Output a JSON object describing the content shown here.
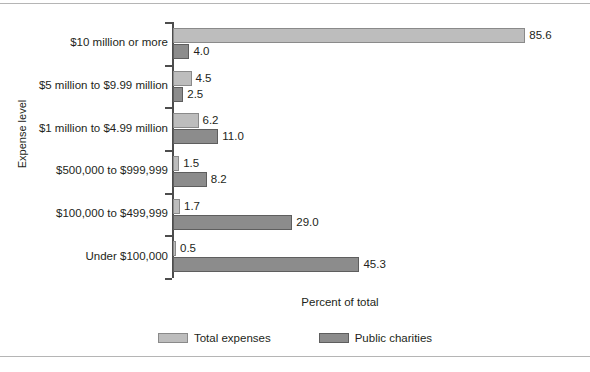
{
  "chart_data": {
    "type": "bar",
    "orientation": "horizontal",
    "title": "",
    "xlabel": "Percent of total",
    "ylabel": "Expense level",
    "xlim": [
      0,
      90
    ],
    "grid": false,
    "legend_position": "bottom",
    "categories": [
      "$10 million or more",
      "$5 million to $9.99 million",
      "$1 million to $4.99 million",
      "$500,000 to $999,999",
      "$100,000 to $499,999",
      "Under $100,000"
    ],
    "series": [
      {
        "name": "Total expenses",
        "color": "#bdbdbd",
        "values": [
          85.6,
          4.5,
          6.2,
          1.5,
          1.7,
          0.5
        ],
        "labels": [
          "85.6",
          "4.5",
          "6.2",
          "1.5",
          "1.7",
          "0.5"
        ]
      },
      {
        "name": "Public charities",
        "color": "#8c8c8c",
        "values": [
          4.0,
          2.5,
          11.0,
          8.2,
          29.0,
          45.3
        ],
        "labels": [
          "4.0",
          "2.5",
          "11.0",
          "8.2",
          "29.0",
          "45.3"
        ]
      }
    ]
  },
  "legend": {
    "items": [
      {
        "label": "Total expenses",
        "swatch": "legend-swatch-total-expenses"
      },
      {
        "label": "Public charities",
        "swatch": "legend-swatch-public-charities"
      }
    ]
  }
}
